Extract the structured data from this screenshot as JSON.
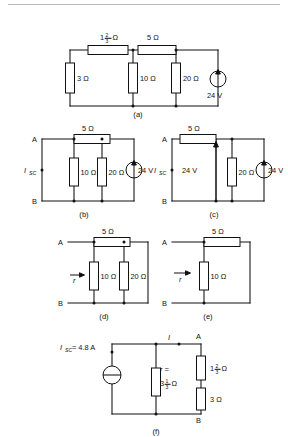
{
  "document": {
    "type": "circuit-diagram-figure",
    "description": "Six-part circuit analysis figure showing source transformation and short-circuit current derivation",
    "background_color": "#ffffff",
    "line_color": "#111111",
    "rule_color": "#b8b8b8"
  },
  "units": {
    "ohm": "Ω",
    "volt": "V",
    "amp": "A"
  },
  "figures": [
    {
      "id": "a",
      "caption": "(a)",
      "components": [
        {
          "name": "series-resistor-top-left",
          "label": "1⅔ Ω",
          "whole": "1",
          "numerator": "2",
          "denominator": "3",
          "unit": "Ω",
          "orientation": "horizontal"
        },
        {
          "name": "series-resistor-top-right",
          "label": "5 Ω",
          "value": "5",
          "unit": "Ω",
          "orientation": "horizontal"
        },
        {
          "name": "shunt-resistor-1",
          "label": "3 Ω",
          "value": "3",
          "unit": "Ω",
          "orientation": "vertical"
        },
        {
          "name": "shunt-resistor-2",
          "label": "10 Ω",
          "value": "10",
          "unit": "Ω",
          "orientation": "vertical"
        },
        {
          "name": "shunt-resistor-3",
          "label": "20 Ω",
          "value": "20",
          "unit": "Ω",
          "orientation": "vertical"
        },
        {
          "name": "voltage-source",
          "label": "24 V",
          "value": "24",
          "unit": "V",
          "symbol": "circle-with-arrow"
        }
      ]
    },
    {
      "id": "b",
      "caption": "(b)",
      "terminals": {
        "top": "A",
        "bottom": "B"
      },
      "current_label": {
        "symbol": "I",
        "subscript": "SC"
      },
      "components": [
        {
          "name": "series-resistor-top",
          "label": "5 Ω",
          "value": "5",
          "unit": "Ω",
          "orientation": "horizontal"
        },
        {
          "name": "shunt-resistor-1",
          "label": "10 Ω",
          "value": "10",
          "unit": "Ω",
          "orientation": "vertical"
        },
        {
          "name": "shunt-resistor-2",
          "label": "20 Ω",
          "value": "20",
          "unit": "Ω",
          "orientation": "vertical"
        },
        {
          "name": "voltage-source",
          "label": "24 V",
          "value": "24",
          "unit": "V",
          "symbol": "circle-with-arrow"
        }
      ]
    },
    {
      "id": "c",
      "caption": "(c)",
      "terminals": {
        "top": "A",
        "bottom": "B"
      },
      "current_label": {
        "symbol": "I",
        "subscript": "SC"
      },
      "components": [
        {
          "name": "series-resistor-top",
          "label": "5 Ω",
          "value": "5",
          "unit": "Ω",
          "orientation": "horizontal"
        },
        {
          "name": "voltage-source-left",
          "label": "24 V",
          "value": "24",
          "unit": "V",
          "symbol": "arrow-only"
        },
        {
          "name": "shunt-resistor",
          "label": "20 Ω",
          "value": "20",
          "unit": "Ω",
          "orientation": "vertical"
        },
        {
          "name": "voltage-source-right",
          "label": "24 V",
          "value": "24",
          "unit": "V",
          "symbol": "circle-with-arrow"
        }
      ]
    },
    {
      "id": "d",
      "caption": "(d)",
      "terminals": {
        "top": "A",
        "bottom": "B"
      },
      "resistance_label": {
        "symbol": "r"
      },
      "components": [
        {
          "name": "series-resistor-top",
          "label": "5 Ω",
          "value": "5",
          "unit": "Ω",
          "orientation": "horizontal"
        },
        {
          "name": "shunt-resistor-1",
          "label": "10 Ω",
          "value": "10",
          "unit": "Ω",
          "orientation": "vertical"
        },
        {
          "name": "shunt-resistor-2",
          "label": "20 Ω",
          "value": "20",
          "unit": "Ω",
          "orientation": "vertical"
        }
      ]
    },
    {
      "id": "e",
      "caption": "(e)",
      "terminals": {
        "top": "A",
        "bottom": "B"
      },
      "resistance_label": {
        "symbol": "r"
      },
      "components": [
        {
          "name": "series-resistor-top",
          "label": "5 Ω",
          "value": "5",
          "unit": "Ω",
          "orientation": "horizontal"
        },
        {
          "name": "shunt-resistor",
          "label": "10 Ω",
          "value": "10",
          "unit": "Ω",
          "orientation": "vertical"
        }
      ]
    },
    {
      "id": "f",
      "caption": "(f)",
      "terminals": {
        "top": "A",
        "bottom": "B"
      },
      "current_source_label": {
        "symbol": "I",
        "subscript": "SC",
        "equals": "= 4.8 A",
        "value": "4.8",
        "unit": "A"
      },
      "branch_current_label": {
        "symbol": "I"
      },
      "components": [
        {
          "name": "current-source",
          "label": "Iₛc = 4.8 A",
          "symbol": "circle-with-bar"
        },
        {
          "name": "shunt-resistor-r",
          "label": "r = 3⅓ Ω",
          "prefix": "r =",
          "whole": "3",
          "numerator": "1",
          "denominator": "3",
          "unit": "Ω",
          "orientation": "vertical"
        },
        {
          "name": "series-resistor-upper-right",
          "label": "1⅔ Ω",
          "whole": "1",
          "numerator": "2",
          "denominator": "3",
          "unit": "Ω",
          "orientation": "vertical"
        },
        {
          "name": "series-resistor-lower-right",
          "label": "3 Ω",
          "value": "3",
          "unit": "Ω",
          "orientation": "vertical"
        }
      ]
    }
  ]
}
